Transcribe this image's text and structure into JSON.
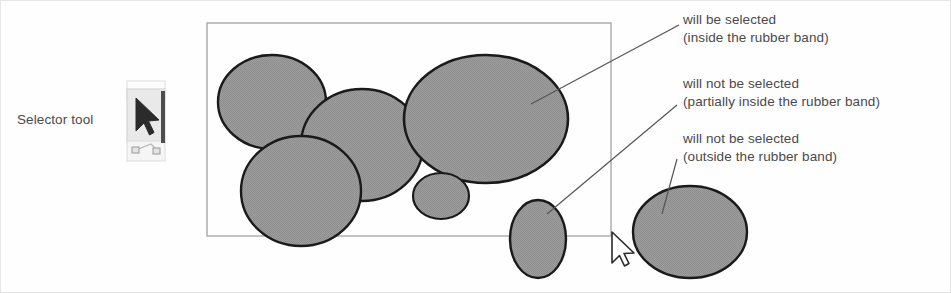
{
  "figure": {
    "background_color": "#ffffff",
    "shape_fill_color": "#9a9a9a",
    "shape_stroke_color": "#1a1a1a",
    "rubber_band_color": "#a8a8a8",
    "text_color": "#4a4a4a",
    "leader_line_color": "#555555"
  },
  "selector": {
    "label": "Selector tool",
    "icon": "arrow-cursor-icon"
  },
  "rubber_band": {
    "x": 206,
    "y": 22,
    "width": 404,
    "height": 213
  },
  "cursor": {
    "x": 611,
    "y": 231,
    "icon": "mouse-arrow-pointer-icon"
  },
  "annotations": [
    {
      "id": "annotation-inside",
      "line1": "will be selected",
      "line2": "(inside the rubber band)",
      "x": 682,
      "y": 10,
      "leader": {
        "x1": 678,
        "y1": 24,
        "x2": 530,
        "y2": 103
      }
    },
    {
      "id": "annotation-partial",
      "line1": "will not be selected",
      "line2": "(partially inside the rubber band)",
      "x": 682,
      "y": 74,
      "leader": {
        "x1": 676,
        "y1": 104,
        "x2": 546,
        "y2": 213
      }
    },
    {
      "id": "annotation-outside",
      "line1": "will not be selected",
      "line2": "(outside the rubber band)",
      "x": 682,
      "y": 129,
      "leader": {
        "x1": 676,
        "y1": 158,
        "x2": 661,
        "y2": 213
      }
    }
  ],
  "shapes": [
    {
      "name": "ellipse-top-left",
      "cx": 271,
      "cy": 101,
      "rx": 54,
      "ry": 47,
      "state": "inside"
    },
    {
      "name": "ellipse-center",
      "cx": 361,
      "cy": 144,
      "rx": 61,
      "ry": 56,
      "state": "inside"
    },
    {
      "name": "ellipse-big-right",
      "cx": 485,
      "cy": 118,
      "rx": 82,
      "ry": 64,
      "state": "inside"
    },
    {
      "name": "ellipse-bottom-left",
      "cx": 300,
      "cy": 190,
      "rx": 60,
      "ry": 55,
      "state": "inside"
    },
    {
      "name": "ellipse-small-mid",
      "cx": 440,
      "cy": 195,
      "rx": 28,
      "ry": 23,
      "state": "inside"
    },
    {
      "name": "ellipse-straddle",
      "cx": 537,
      "cy": 238,
      "rx": 28,
      "ry": 39,
      "state": "partial"
    },
    {
      "name": "ellipse-far-right",
      "cx": 689,
      "cy": 231,
      "rx": 57,
      "ry": 46,
      "state": "outside"
    }
  ]
}
